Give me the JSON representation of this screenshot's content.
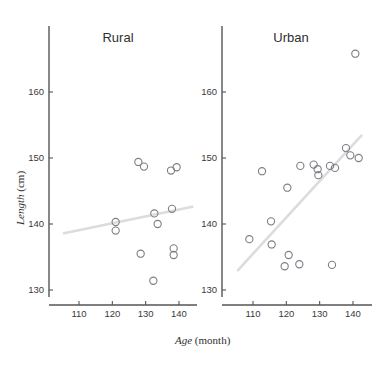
{
  "chart_data": {
    "type": "scatter",
    "title": "",
    "xlabel": "Age (month)",
    "ylabel": "Length (cm)",
    "xlabel_italic_part": "Age",
    "xlabel_plain_part": " (month)",
    "ylabel_italic_part": "Length",
    "ylabel_plain_part": " (cm)",
    "grid": false,
    "legend": "none",
    "xlim": [
      104,
      146
    ],
    "ylim": [
      128,
      168
    ],
    "xticks": [
      110,
      120,
      130,
      140
    ],
    "yticks": [
      130,
      140,
      150,
      160
    ],
    "xtick_labels": [
      "110",
      "120",
      "130",
      "140"
    ],
    "ytick_labels": [
      "130",
      "140",
      "150",
      "160"
    ],
    "marker": "open-circle",
    "marker_color": "#7d7d84",
    "trendline_color": "#dcdcdc",
    "axis_color": "#555555",
    "panels": [
      {
        "name": "Rural",
        "label": "Rural",
        "points": [
          {
            "x": 121.0,
            "y": 140.3
          },
          {
            "x": 121.0,
            "y": 139.0
          },
          {
            "x": 127.8,
            "y": 149.4
          },
          {
            "x": 129.5,
            "y": 148.7
          },
          {
            "x": 128.5,
            "y": 135.5
          },
          {
            "x": 132.3,
            "y": 131.4
          },
          {
            "x": 132.6,
            "y": 141.6
          },
          {
            "x": 133.6,
            "y": 140.0
          },
          {
            "x": 137.6,
            "y": 148.1
          },
          {
            "x": 139.3,
            "y": 148.6
          },
          {
            "x": 137.9,
            "y": 142.3
          },
          {
            "x": 138.4,
            "y": 136.3
          },
          {
            "x": 138.4,
            "y": 135.3
          }
        ],
        "trendline": {
          "x1": 105.5,
          "y1": 138.6,
          "x2": 144.0,
          "y2": 142.6
        }
      },
      {
        "name": "Urban",
        "label": "Urban",
        "points": [
          {
            "x": 108.9,
            "y": 137.7
          },
          {
            "x": 112.7,
            "y": 148.0
          },
          {
            "x": 115.4,
            "y": 140.4
          },
          {
            "x": 115.6,
            "y": 136.9
          },
          {
            "x": 119.5,
            "y": 133.6
          },
          {
            "x": 120.3,
            "y": 145.5
          },
          {
            "x": 120.7,
            "y": 135.3
          },
          {
            "x": 123.9,
            "y": 133.9
          },
          {
            "x": 124.2,
            "y": 148.8
          },
          {
            "x": 128.2,
            "y": 149.0
          },
          {
            "x": 129.4,
            "y": 148.3
          },
          {
            "x": 129.6,
            "y": 147.4
          },
          {
            "x": 133.7,
            "y": 133.8
          },
          {
            "x": 133.1,
            "y": 148.8
          },
          {
            "x": 134.6,
            "y": 148.5
          },
          {
            "x": 137.9,
            "y": 151.5
          },
          {
            "x": 139.2,
            "y": 150.4
          },
          {
            "x": 141.7,
            "y": 150.0
          },
          {
            "x": 140.7,
            "y": 165.8
          }
        ],
        "trendline": {
          "x1": 105.5,
          "y1": 133.0,
          "x2": 142.5,
          "y2": 153.4
        }
      }
    ]
  }
}
